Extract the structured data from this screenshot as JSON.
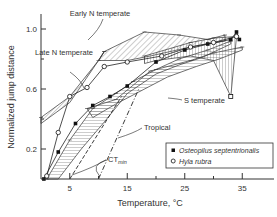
{
  "chart_data": {
    "type": "line",
    "title": "",
    "xlabel": "Temperature, °C",
    "ylabel": "Normalized jump distance",
    "xlim": [
      0,
      40
    ],
    "ylim": [
      0,
      1.1
    ],
    "x_ticks": [
      5,
      15,
      25,
      35
    ],
    "x_minor_ticks": [
      10,
      20,
      30
    ],
    "y_ticks": [
      0.2,
      0.6,
      1.0
    ],
    "y_minor_ticks": [
      0.4,
      0.8
    ],
    "grid": false,
    "legend_position": "lower right",
    "legend": [
      {
        "label": "Osteopilus septentrionalis",
        "marker": "filled-square"
      },
      {
        "label": "Hyla rubra",
        "marker": "open-circle"
      }
    ],
    "annotations": [
      {
        "text": "Early N temperate",
        "x": 15,
        "y": 1.05
      },
      {
        "text": "Late N temperate",
        "x": 5,
        "y": 0.92
      },
      {
        "text": "S temperate",
        "x": 24,
        "y": 0.65
      },
      {
        "text": "Tropical",
        "x": 18.5,
        "y": 0.33
      },
      {
        "text": "CT",
        "sub": "min",
        "x": 14,
        "y": 0.11
      }
    ],
    "envelopes": [
      {
        "name": "Early N temperate",
        "pattern": "diagonal",
        "upper": [
          [
            11,
            0.85
          ],
          [
            18,
            0.98
          ],
          [
            24,
            0.96
          ],
          [
            29,
            0.93
          ],
          [
            32,
            0.96
          ]
        ],
        "lower": [
          [
            32,
            0.92
          ],
          [
            26,
            0.88
          ],
          [
            19,
            0.82
          ],
          [
            15,
            0.79
          ],
          [
            10,
            0.79
          ]
        ]
      },
      {
        "name": "Late N temperate",
        "pattern": "diagonal-dense",
        "upper": [
          [
            0,
            0.41
          ],
          [
            5,
            0.55
          ],
          [
            10,
            0.79
          ],
          [
            11,
            0.85
          ]
        ],
        "lower": [
          [
            10,
            0.79
          ],
          [
            5,
            0.51
          ],
          [
            0,
            0.37
          ]
        ]
      },
      {
        "name": "S temperate",
        "pattern": "horizontal",
        "upper": [
          [
            8,
            0.47
          ],
          [
            13,
            0.53
          ],
          [
            19,
            0.72
          ],
          [
            26,
            0.79
          ],
          [
            30,
            0.84
          ],
          [
            35,
            0.88
          ]
        ],
        "lower": [
          [
            35,
            0.86
          ],
          [
            31,
            0.8
          ],
          [
            27,
            0.75
          ],
          [
            22,
            0.68
          ],
          [
            17,
            0.58
          ],
          [
            13,
            0.5
          ],
          [
            9,
            0.41
          ]
        ]
      },
      {
        "name": "Tropical",
        "pattern": "horizontal",
        "upper": [
          [
            1,
            0.0
          ],
          [
            5,
            0.26
          ],
          [
            9,
            0.47
          ],
          [
            13,
            0.57
          ],
          [
            16,
            0.65
          ],
          [
            20,
            0.73
          ],
          [
            24,
            0.8
          ],
          [
            29,
            0.86
          ],
          [
            33,
            0.92
          ]
        ],
        "lower": [
          [
            33,
            0.9
          ],
          [
            28,
            0.81
          ],
          [
            24,
            0.76
          ],
          [
            20,
            0.7
          ],
          [
            15,
            0.57
          ],
          [
            11,
            0.38
          ],
          [
            7,
            0.2
          ],
          [
            3,
            0.0
          ]
        ]
      },
      {
        "name": "Hyla rubra envelope",
        "pattern": "vertical",
        "upper": [
          [
            18,
            0.82
          ],
          [
            26,
            0.91
          ],
          [
            30,
            0.94
          ],
          [
            34,
            0.95
          ]
        ],
        "lower": [
          [
            33,
            0.55
          ],
          [
            30,
            0.79
          ],
          [
            26,
            0.82
          ],
          [
            20,
            0.79
          ],
          [
            18,
            0.77
          ]
        ]
      }
    ],
    "series": [
      {
        "name": "Osteopilus septentrionalis",
        "marker": "filled-square",
        "x": [
          0.5,
          3,
          6,
          9,
          12,
          15,
          20,
          25,
          29,
          33,
          34,
          34.5
        ],
        "y": [
          0.0,
          0.18,
          0.37,
          0.49,
          0.55,
          0.62,
          0.78,
          0.86,
          0.9,
          0.93,
          0.98,
          0.93
        ]
      },
      {
        "name": "Hyla rubra",
        "marker": "open-circle",
        "x": [
          1,
          3,
          5,
          8,
          11,
          15,
          21,
          26,
          30,
          34
        ],
        "y": [
          0.02,
          0.31,
          0.55,
          0.61,
          0.75,
          0.78,
          0.82,
          0.88,
          0.91,
          0.95
        ]
      },
      {
        "name": "Hyla rubra drop",
        "marker": "open-square",
        "x": [
          33
        ],
        "y": [
          0.55
        ]
      }
    ],
    "ctmin_lines": [
      {
        "x0": 5,
        "y0": 0.0,
        "x1": 14,
        "y1": 0.55,
        "style": "dashed"
      },
      {
        "x0": 10,
        "y0": 0.0,
        "x1": 17,
        "y1": 0.6,
        "style": "dash-dot"
      }
    ]
  }
}
